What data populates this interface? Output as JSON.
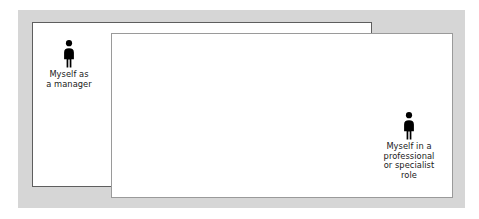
{
  "figure": {
    "background_color": "#ffffff",
    "frame_color": "#d6d6d6",
    "box_fill_color": "#ffffff",
    "box_back_border_color": "#5e5e5e",
    "box_front_border_color": "#9a9a9a",
    "icon_color": "#000000",
    "text_color": "#1a1a1a"
  },
  "roles": {
    "manager": {
      "icon_name": "person-pictogram-icon",
      "caption": "Myself as\na manager",
      "caption_lines": [
        "Myself as",
        "a manager"
      ]
    },
    "specialist": {
      "icon_name": "person-pictogram-icon",
      "caption": "Myself in a\nprofessional\nor specialist\nrole",
      "caption_lines": [
        "Myself in a",
        "professional",
        "or specialist",
        "role"
      ]
    }
  }
}
